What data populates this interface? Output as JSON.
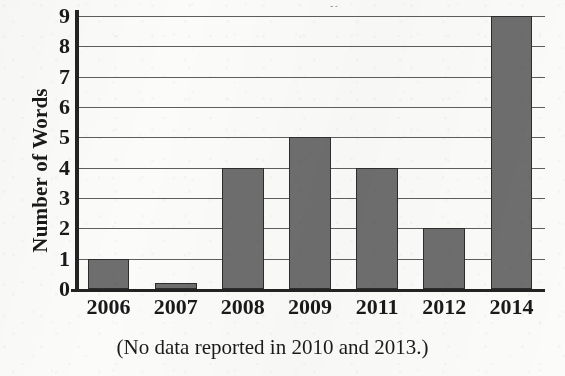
{
  "chart_data": {
    "type": "bar",
    "title": "",
    "xlabel": "",
    "ylabel": "Number of Words",
    "categories": [
      "2006",
      "2007",
      "2008",
      "2009",
      "2011",
      "2012",
      "2014"
    ],
    "values": [
      1,
      0,
      4,
      5,
      4,
      2,
      9
    ],
    "ylim": [
      0,
      9
    ],
    "ytick_labels": [
      "0",
      "1",
      "2",
      "3",
      "4",
      "5",
      "6",
      "7",
      "8",
      "9"
    ],
    "ytick_values": [
      0,
      1,
      2,
      3,
      4,
      5,
      6,
      7,
      8,
      9
    ],
    "grid": true,
    "grid_axis": "y",
    "legend": false,
    "legend_position": "none",
    "caption": "(No data reported in 2010 and 2013.)",
    "bar_color": "#6e6e6e",
    "bar_edge_color": "#2d2d2d",
    "axis_color": "#232323",
    "gridline_color": "#5d5d5d",
    "background_color": "#fbfbfa"
  },
  "figure": {
    "title_remnant": "y",
    "caption": "(No data reported in 2010 and 2013.)"
  }
}
